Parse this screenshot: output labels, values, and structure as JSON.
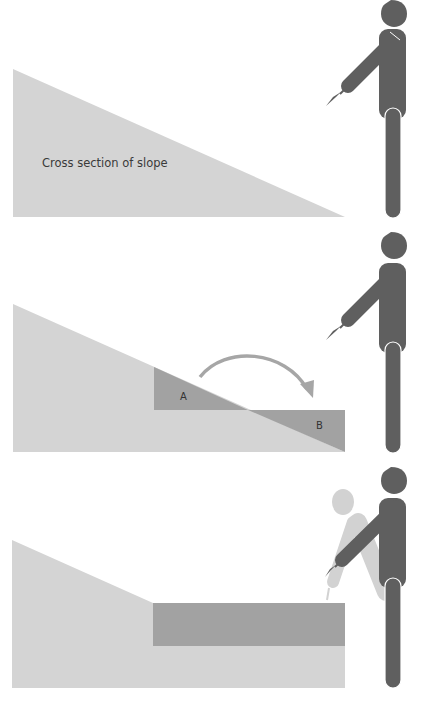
{
  "colors": {
    "ground_light": "#d4d4d4",
    "ground_dark": "#a2a2a2",
    "figure_dark": "#5f5f5f",
    "figure_ghost": "#d2d2d2",
    "arrow": "#a6a6a6",
    "background": "#ffffff"
  },
  "panels": [
    {
      "id": "original-slope",
      "caption": "Cross section of slope"
    },
    {
      "id": "cut-and-fill",
      "cut_label": "A",
      "fill_label": "B"
    },
    {
      "id": "terraced-result"
    }
  ]
}
